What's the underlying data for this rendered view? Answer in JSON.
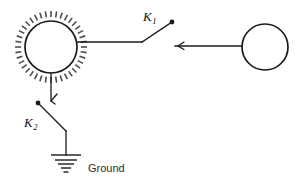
{
  "figure": {
    "title": "Charged sphere connected through switches to an uncharged sphere and to ground",
    "background_color": "#ffffff",
    "line_color": "#1a1a1a",
    "charge_dash_color": "#4d4d4d"
  },
  "spheres": {
    "charged": {
      "name": "charged-sphere",
      "cx": 51,
      "cy": 47,
      "r": 26,
      "charged": true,
      "dash_count": 40,
      "dash_inner_gap": 4,
      "dash_length": 6
    },
    "uncharged": {
      "name": "uncharged-sphere",
      "cx": 265,
      "cy": 47,
      "r": 23,
      "charged": false
    }
  },
  "switches": {
    "k1": {
      "label": "K",
      "subscript": "1",
      "label_x": 143,
      "label_y": 21,
      "pivot_x": 142,
      "pivot_y": 42,
      "blade_end_x": 172,
      "blade_end_y": 22,
      "state": "open"
    },
    "k2": {
      "label": "K",
      "subscript": "2",
      "label_x": 24,
      "label_y": 127,
      "pivot_x": 38,
      "pivot_y": 103,
      "blade_end_x": 66,
      "blade_end_y": 131,
      "state": "open"
    }
  },
  "wires": {
    "sphere_to_k1": {
      "x1": 77,
      "y1": 42,
      "x2": 142,
      "y2": 42
    },
    "k1_to_sphere2": {
      "x1": 175,
      "y1": 46,
      "x2": 242,
      "y2": 46
    },
    "sphere_to_k2": {
      "x1": 51,
      "y1": 73,
      "x2": 51,
      "y2": 101
    },
    "k2_to_ground": {
      "x1": 66,
      "y1": 131,
      "x2": 66,
      "y2": 155
    }
  },
  "arrows": {
    "near_charged_sphere": {
      "x": 51,
      "y": 101,
      "direction": "left"
    },
    "on_right_wire": {
      "x": 178,
      "y": 46,
      "direction": "left"
    }
  },
  "ground": {
    "label": "Ground",
    "label_x": 88,
    "label_y": 172,
    "x": 66,
    "top_y": 155,
    "bars": [
      {
        "half_width": 15,
        "y": 155
      },
      {
        "half_width": 11,
        "y": 160
      },
      {
        "half_width": 8,
        "y": 164
      },
      {
        "half_width": 5,
        "y": 168
      },
      {
        "half_width": 2.5,
        "y": 172
      }
    ]
  }
}
